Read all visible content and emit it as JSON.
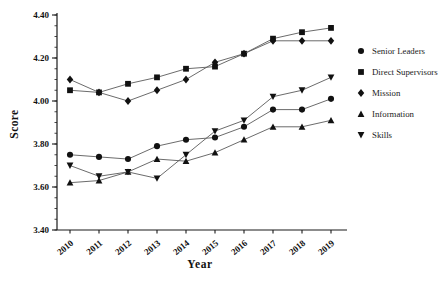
{
  "chart_data": {
    "type": "line",
    "title": "",
    "xlabel": "Year",
    "ylabel": "Score",
    "categories": [
      "2010",
      "2011",
      "2012",
      "2013",
      "2014",
      "2015",
      "2016",
      "2017",
      "2018",
      "2019"
    ],
    "ylim": [
      3.4,
      4.4
    ],
    "yticks": [
      3.4,
      3.6,
      3.8,
      4.0,
      4.2,
      4.4
    ],
    "ytick_labels": [
      "3.40",
      "3.60",
      "3.80",
      "4.00",
      "4.20",
      "4.40"
    ],
    "minor_tick_step": 0.05,
    "grid": false,
    "legend_position": "right",
    "series": [
      {
        "name": "Senior Leaders",
        "marker": "circle",
        "values": [
          3.75,
          3.74,
          3.73,
          3.79,
          3.82,
          3.83,
          3.88,
          3.96,
          3.96,
          4.01
        ]
      },
      {
        "name": "Direct Supervisors",
        "marker": "square",
        "values": [
          4.05,
          4.04,
          4.08,
          4.11,
          4.15,
          4.16,
          4.22,
          4.29,
          4.32,
          4.34
        ]
      },
      {
        "name": "Mission",
        "marker": "diamond",
        "values": [
          4.1,
          4.04,
          4.0,
          4.05,
          4.1,
          4.18,
          4.22,
          4.28,
          4.28,
          4.28
        ]
      },
      {
        "name": "Information",
        "marker": "triangle-up",
        "values": [
          3.62,
          3.63,
          3.67,
          3.73,
          3.72,
          3.76,
          3.82,
          3.88,
          3.88,
          3.91
        ]
      },
      {
        "name": "Skills",
        "marker": "triangle-down",
        "values": [
          3.7,
          3.65,
          3.67,
          3.64,
          3.75,
          3.86,
          3.91,
          4.02,
          4.05,
          4.11
        ]
      }
    ],
    "colors": {
      "background": "#ffffff",
      "axis": "#1a1a1a",
      "line": "#5a5a5a",
      "marker": "#111111",
      "text": "#111111"
    }
  }
}
